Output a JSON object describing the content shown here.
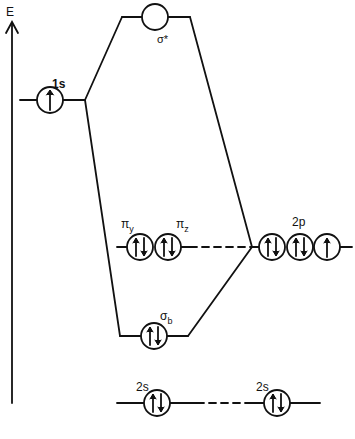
{
  "diagram": {
    "type": "molecular-orbital-diagram",
    "axis": {
      "label": "E",
      "direction": "up"
    },
    "colors": {
      "line": "#111111",
      "background": "#ffffff"
    },
    "left_atom": {
      "orbitals": [
        {
          "id": "1s",
          "label": "1s",
          "electrons": "↑"
        }
      ]
    },
    "right_atom": {
      "orbitals": [
        {
          "id": "2p",
          "label": "2p",
          "boxes": [
            "↑↓",
            "↑↓",
            "↑"
          ]
        },
        {
          "id": "2s-right",
          "label": "2s",
          "electrons": "↑↓"
        }
      ]
    },
    "molecular_orbitals": [
      {
        "id": "sigma-star",
        "label": "σ*",
        "electrons": ""
      },
      {
        "id": "pi-y",
        "label_main": "π",
        "label_sub": "y",
        "electrons": "↑↓",
        "nonbonding": true
      },
      {
        "id": "pi-z",
        "label_main": "π",
        "label_sub": "z",
        "electrons": "↑↓",
        "nonbonding": true
      },
      {
        "id": "sigma-b",
        "label_main": "σ",
        "label_sub": "b",
        "electrons": "↑↓"
      },
      {
        "id": "2s-left",
        "label": "2s",
        "electrons": "↑↓",
        "nonbonding": true
      }
    ]
  }
}
